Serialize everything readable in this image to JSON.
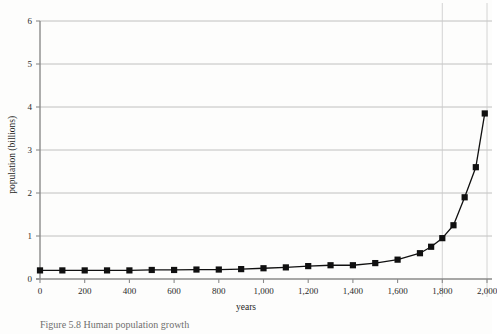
{
  "figure": {
    "caption_prefix": "Figure 5.8",
    "caption_text": "Figure 5.8  Human population growth",
    "background_color": "#fdfdfc"
  },
  "chart_data": {
    "type": "line",
    "title": "",
    "xlabel": "years",
    "ylabel": "population (billions)",
    "xlim": [
      0,
      2000
    ],
    "ylim": [
      0,
      6
    ],
    "grid": true,
    "grid_color": "#b0b0b0",
    "legend": "none",
    "series_color": "#101010",
    "marker": "square",
    "note": "right edge of the figure is cropped; the final plotted point near year 2000 is clipped",
    "x_ticks": [
      0,
      200,
      400,
      600,
      800,
      1000,
      1200,
      1400,
      1600,
      1800,
      2000
    ],
    "x_tick_labels": [
      "0",
      "200",
      "400",
      "600",
      "800",
      "1,000",
      "1,200",
      "1,400",
      "1,600",
      "1,800",
      "2,000"
    ],
    "y_ticks": [
      0,
      1,
      2,
      3,
      4,
      5,
      6
    ],
    "y_tick_labels": [
      "0",
      "1",
      "2",
      "3",
      "4",
      "5",
      "6"
    ],
    "x": [
      0,
      100,
      200,
      300,
      400,
      500,
      600,
      700,
      800,
      900,
      1000,
      1100,
      1200,
      1300,
      1400,
      1500,
      1600,
      1700,
      1750,
      1800,
      1850,
      1900,
      1950,
      1990
    ],
    "values": [
      0.2,
      0.2,
      0.2,
      0.2,
      0.2,
      0.21,
      0.21,
      0.22,
      0.22,
      0.23,
      0.25,
      0.27,
      0.3,
      0.32,
      0.32,
      0.37,
      0.45,
      0.6,
      0.75,
      0.95,
      1.25,
      1.9,
      2.6,
      3.85
    ],
    "series": [
      {
        "name": "world population",
        "values": [
          0.2,
          0.2,
          0.2,
          0.2,
          0.2,
          0.21,
          0.21,
          0.22,
          0.22,
          0.23,
          0.25,
          0.27,
          0.3,
          0.32,
          0.32,
          0.37,
          0.45,
          0.6,
          0.75,
          0.95,
          1.25,
          1.9,
          2.6,
          3.85
        ]
      }
    ]
  }
}
